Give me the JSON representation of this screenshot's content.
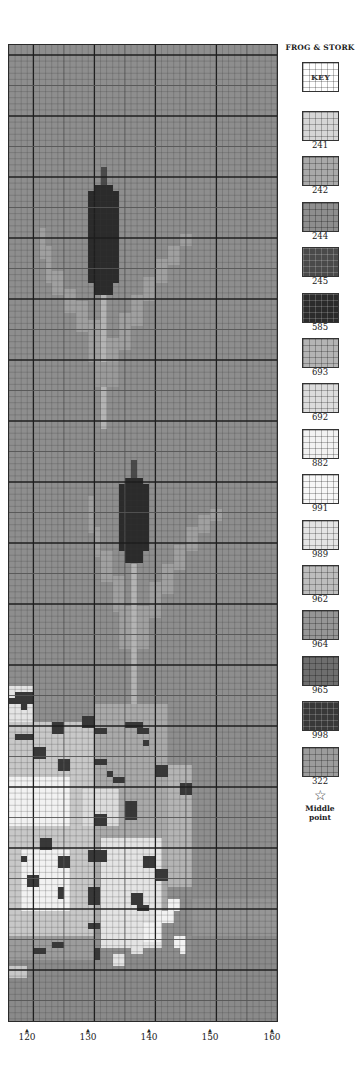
{
  "legend": {
    "title": "FROG & STORK",
    "key_label": "KEY",
    "items": [
      {
        "code": "241",
        "color": "#d6d6d6"
      },
      {
        "code": "242",
        "color": "#a9a9a9"
      },
      {
        "code": "244",
        "color": "#8e8e8e"
      },
      {
        "code": "245",
        "color": "#4a4a4a"
      },
      {
        "code": "585",
        "color": "#2b2b2b"
      },
      {
        "code": "693",
        "color": "#b4b4b4"
      },
      {
        "code": "692",
        "color": "#dcdcdc"
      },
      {
        "code": "882",
        "color": "#f2f2f2"
      },
      {
        "code": "991",
        "color": "#f7f7f7"
      },
      {
        "code": "989",
        "color": "#e4e4e4"
      },
      {
        "code": "962",
        "color": "#bdbdbd"
      },
      {
        "code": "964",
        "color": "#969696"
      },
      {
        "code": "965",
        "color": "#6e6e6e"
      },
      {
        "code": "998",
        "color": "#383838"
      },
      {
        "code": "322",
        "color": "#9c9c9c"
      }
    ],
    "middle_symbol": "☆",
    "middle_label_line1": "Middle",
    "middle_label_line2": "point"
  },
  "axis": {
    "ticks": [
      {
        "label": "120",
        "x": 27
      },
      {
        "label": "130",
        "x": 88
      },
      {
        "label": "140",
        "x": 149
      },
      {
        "label": "150",
        "x": 210
      },
      {
        "label": "160",
        "x": 272
      }
    ],
    "arrow": "▲"
  },
  "chart_data": {
    "type": "heatmap",
    "columns": 44,
    "rows": 160,
    "cell_px": 6.1,
    "background_color": "#8e8e8e",
    "x_ticks": [
      "120",
      "130",
      "140",
      "150",
      "160"
    ],
    "grid": {
      "minor_every": 1,
      "medium_every": 5,
      "major_every": 10
    },
    "rects": [
      {
        "c": 15,
        "r": 20,
        "w": 1,
        "h": 3,
        "color": "#4a4a4a"
      },
      {
        "c": 14,
        "r": 23,
        "w": 3,
        "h": 1,
        "color": "#2b2b2b"
      },
      {
        "c": 13,
        "r": 24,
        "w": 5,
        "h": 15,
        "color": "#2b2b2b"
      },
      {
        "c": 14,
        "r": 39,
        "w": 3,
        "h": 2,
        "color": "#2b2b2b"
      },
      {
        "c": 15,
        "r": 41,
        "w": 1,
        "h": 22,
        "color": "#b4b4b4"
      },
      {
        "c": 5,
        "r": 30,
        "w": 1,
        "h": 5,
        "color": "#a0a0a0"
      },
      {
        "c": 6,
        "r": 33,
        "w": 1,
        "h": 6,
        "color": "#a0a0a0"
      },
      {
        "c": 7,
        "r": 37,
        "w": 2,
        "h": 4,
        "color": "#a0a0a0"
      },
      {
        "c": 9,
        "r": 40,
        "w": 2,
        "h": 4,
        "color": "#a0a0a0"
      },
      {
        "c": 11,
        "r": 42,
        "w": 2,
        "h": 5,
        "color": "#a0a0a0"
      },
      {
        "c": 13,
        "r": 45,
        "w": 2,
        "h": 7,
        "color": "#a0a0a0"
      },
      {
        "c": 28,
        "r": 31,
        "w": 2,
        "h": 2,
        "color": "#a0a0a0"
      },
      {
        "c": 26,
        "r": 33,
        "w": 2,
        "h": 3,
        "color": "#a0a0a0"
      },
      {
        "c": 24,
        "r": 35,
        "w": 2,
        "h": 4,
        "color": "#a0a0a0"
      },
      {
        "c": 22,
        "r": 38,
        "w": 2,
        "h": 4,
        "color": "#a0a0a0"
      },
      {
        "c": 20,
        "r": 41,
        "w": 2,
        "h": 5,
        "color": "#a0a0a0"
      },
      {
        "c": 18,
        "r": 44,
        "w": 2,
        "h": 6,
        "color": "#a0a0a0"
      },
      {
        "c": 16,
        "r": 48,
        "w": 2,
        "h": 7,
        "color": "#a0a0a0"
      },
      {
        "c": 14,
        "r": 52,
        "w": 4,
        "h": 4,
        "color": "#9a9a9a"
      },
      {
        "c": 20,
        "r": 68,
        "w": 1,
        "h": 3,
        "color": "#4a4a4a"
      },
      {
        "c": 19,
        "r": 71,
        "w": 3,
        "h": 1,
        "color": "#2b2b2b"
      },
      {
        "c": 18,
        "r": 72,
        "w": 5,
        "h": 11,
        "color": "#2b2b2b"
      },
      {
        "c": 19,
        "r": 83,
        "w": 3,
        "h": 2,
        "color": "#2b2b2b"
      },
      {
        "c": 20,
        "r": 85,
        "w": 1,
        "h": 26,
        "color": "#b4b4b4"
      },
      {
        "c": 13,
        "r": 74,
        "w": 1,
        "h": 6,
        "color": "#a0a0a0"
      },
      {
        "c": 14,
        "r": 79,
        "w": 1,
        "h": 5,
        "color": "#a0a0a0"
      },
      {
        "c": 15,
        "r": 83,
        "w": 2,
        "h": 5,
        "color": "#a0a0a0"
      },
      {
        "c": 17,
        "r": 87,
        "w": 2,
        "h": 6,
        "color": "#a0a0a0"
      },
      {
        "c": 18,
        "r": 92,
        "w": 2,
        "h": 7,
        "color": "#a0a0a0"
      },
      {
        "c": 33,
        "r": 76,
        "w": 2,
        "h": 2,
        "color": "#a0a0a0"
      },
      {
        "c": 31,
        "r": 77,
        "w": 2,
        "h": 3,
        "color": "#a0a0a0"
      },
      {
        "c": 29,
        "r": 79,
        "w": 2,
        "h": 4,
        "color": "#a0a0a0"
      },
      {
        "c": 27,
        "r": 82,
        "w": 2,
        "h": 4,
        "color": "#a0a0a0"
      },
      {
        "c": 25,
        "r": 85,
        "w": 2,
        "h": 5,
        "color": "#a0a0a0"
      },
      {
        "c": 23,
        "r": 88,
        "w": 2,
        "h": 6,
        "color": "#a0a0a0"
      },
      {
        "c": 21,
        "r": 92,
        "w": 2,
        "h": 7,
        "color": "#a0a0a0"
      },
      {
        "c": 0,
        "r": 105,
        "w": 4,
        "h": 6,
        "color": "#e4e4e4"
      },
      {
        "c": 0,
        "r": 111,
        "w": 14,
        "h": 35,
        "color": "#c8c8c8"
      },
      {
        "c": 14,
        "r": 108,
        "w": 12,
        "h": 36,
        "color": "#a9a9a9"
      },
      {
        "c": 26,
        "r": 118,
        "w": 4,
        "h": 20,
        "color": "#b4b4b4"
      },
      {
        "c": 0,
        "r": 120,
        "w": 10,
        "h": 8,
        "color": "#f2f2f2"
      },
      {
        "c": 2,
        "r": 132,
        "w": 8,
        "h": 10,
        "color": "#f2f2f2"
      },
      {
        "c": 15,
        "r": 130,
        "w": 10,
        "h": 18,
        "color": "#e4e4e4"
      },
      {
        "c": 12,
        "r": 122,
        "w": 6,
        "h": 6,
        "color": "#dcdcdc"
      },
      {
        "c": 0,
        "r": 146,
        "w": 14,
        "h": 4,
        "color": "#9c9c9c"
      },
      {
        "c": 30,
        "r": 140,
        "w": 14,
        "h": 6,
        "color": "#969696"
      },
      {
        "c": 30,
        "r": 146,
        "w": 14,
        "h": 14,
        "color": "#8a8a8a"
      },
      {
        "c": 0,
        "r": 150,
        "w": 44,
        "h": 10,
        "color": "#8a8a8a"
      },
      {
        "c": 1,
        "r": 106,
        "w": 3,
        "h": 2,
        "color": "#383838"
      },
      {
        "c": 0,
        "r": 107,
        "w": 2,
        "h": 1,
        "color": "#383838"
      },
      {
        "c": 2,
        "r": 108,
        "w": 1,
        "h": 1,
        "color": "#383838"
      },
      {
        "c": 7,
        "r": 111,
        "w": 2,
        "h": 2,
        "color": "#383838"
      },
      {
        "c": 1,
        "r": 113,
        "w": 3,
        "h": 1,
        "color": "#383838"
      },
      {
        "c": 4,
        "r": 115,
        "w": 2,
        "h": 2,
        "color": "#383838"
      },
      {
        "c": 8,
        "r": 117,
        "w": 2,
        "h": 2,
        "color": "#383838"
      },
      {
        "c": 12,
        "r": 110,
        "w": 2,
        "h": 2,
        "color": "#383838"
      },
      {
        "c": 14,
        "r": 112,
        "w": 2,
        "h": 1,
        "color": "#383838"
      },
      {
        "c": 19,
        "r": 111,
        "w": 3,
        "h": 1,
        "color": "#383838"
      },
      {
        "c": 21,
        "r": 112,
        "w": 2,
        "h": 1,
        "color": "#383838"
      },
      {
        "c": 22,
        "r": 114,
        "w": 1,
        "h": 1,
        "color": "#383838"
      },
      {
        "c": 14,
        "r": 117,
        "w": 2,
        "h": 1,
        "color": "#383838"
      },
      {
        "c": 16,
        "r": 119,
        "w": 1,
        "h": 1,
        "color": "#383838"
      },
      {
        "c": 17,
        "r": 120,
        "w": 2,
        "h": 1,
        "color": "#383838"
      },
      {
        "c": 24,
        "r": 118,
        "w": 2,
        "h": 2,
        "color": "#383838"
      },
      {
        "c": 19,
        "r": 124,
        "w": 2,
        "h": 3,
        "color": "#383838"
      },
      {
        "c": 14,
        "r": 126,
        "w": 2,
        "h": 2,
        "color": "#383838"
      },
      {
        "c": 28,
        "r": 121,
        "w": 2,
        "h": 2,
        "color": "#383838"
      },
      {
        "c": 5,
        "r": 130,
        "w": 2,
        "h": 2,
        "color": "#383838"
      },
      {
        "c": 2,
        "r": 133,
        "w": 1,
        "h": 1,
        "color": "#383838"
      },
      {
        "c": 8,
        "r": 133,
        "w": 2,
        "h": 2,
        "color": "#383838"
      },
      {
        "c": 13,
        "r": 132,
        "w": 3,
        "h": 2,
        "color": "#383838"
      },
      {
        "c": 22,
        "r": 133,
        "w": 2,
        "h": 2,
        "color": "#383838"
      },
      {
        "c": 24,
        "r": 135,
        "w": 2,
        "h": 2,
        "color": "#383838"
      },
      {
        "c": 3,
        "r": 136,
        "w": 2,
        "h": 2,
        "color": "#383838"
      },
      {
        "c": 8,
        "r": 138,
        "w": 1,
        "h": 2,
        "color": "#383838"
      },
      {
        "c": 13,
        "r": 138,
        "w": 2,
        "h": 3,
        "color": "#383838"
      },
      {
        "c": 20,
        "r": 139,
        "w": 2,
        "h": 2,
        "color": "#383838"
      },
      {
        "c": 21,
        "r": 141,
        "w": 2,
        "h": 1,
        "color": "#383838"
      },
      {
        "c": 13,
        "r": 144,
        "w": 2,
        "h": 1,
        "color": "#383838"
      },
      {
        "c": 7,
        "r": 147,
        "w": 2,
        "h": 1,
        "color": "#383838"
      },
      {
        "c": 14,
        "r": 148,
        "w": 1,
        "h": 2,
        "color": "#383838"
      },
      {
        "c": 4,
        "r": 148,
        "w": 2,
        "h": 1,
        "color": "#383838"
      },
      {
        "c": 26,
        "r": 140,
        "w": 2,
        "h": 2,
        "color": "#f2f2f2"
      },
      {
        "c": 24,
        "r": 142,
        "w": 3,
        "h": 2,
        "color": "#f2f2f2"
      },
      {
        "c": 22,
        "r": 144,
        "w": 3,
        "h": 3,
        "color": "#f2f2f2"
      },
      {
        "c": 20,
        "r": 147,
        "w": 2,
        "h": 2,
        "color": "#e4e4e4"
      },
      {
        "c": 17,
        "r": 149,
        "w": 2,
        "h": 2,
        "color": "#e4e4e4"
      },
      {
        "c": 27,
        "r": 146,
        "w": 2,
        "h": 2,
        "color": "#f2f2f2"
      },
      {
        "c": 28,
        "r": 148,
        "w": 1,
        "h": 1,
        "color": "#f2f2f2"
      },
      {
        "c": 0,
        "r": 151,
        "w": 3,
        "h": 2,
        "color": "#c8c8c8"
      }
    ]
  }
}
